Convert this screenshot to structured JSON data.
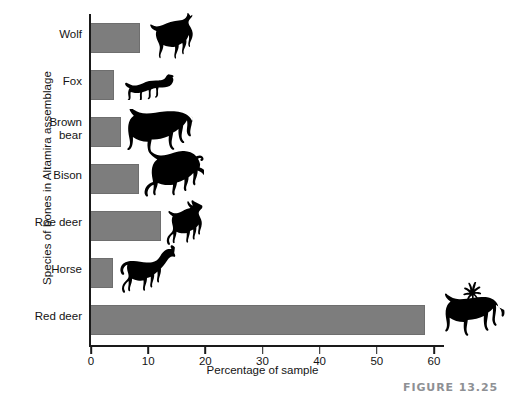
{
  "figure": {
    "caption": "FIGURE 13.25"
  },
  "chart_data": {
    "type": "bar",
    "orientation": "horizontal",
    "title": "",
    "xlabel": "Percentage of sample",
    "ylabel": "Species of bones in Altamira assemblage",
    "xlim": [
      0,
      60
    ],
    "ylim": null,
    "grid": false,
    "legend": null,
    "xticks": [
      0,
      10,
      20,
      30,
      40,
      50,
      60
    ],
    "xticklabels": [
      "0",
      "10",
      "20",
      "30",
      "40",
      "50",
      "60"
    ],
    "categories": [
      "Wolf",
      "Fox",
      "Brown bear",
      "Bison",
      "Roe deer",
      "Horse",
      "Red deer"
    ],
    "values": [
      8.4,
      3.8,
      5.1,
      8.3,
      12.1,
      3.7,
      58.3
    ],
    "bar_color": "#7d7d7d",
    "series": [
      {
        "name": "Percentage of sample",
        "values": [
          8.4,
          3.8,
          5.1,
          8.3,
          12.1,
          3.7,
          58.3
        ]
      }
    ],
    "annotations": [
      {
        "category": "Wolf",
        "icon": "wolf-silhouette"
      },
      {
        "category": "Fox",
        "icon": "fox-silhouette"
      },
      {
        "category": "Brown bear",
        "icon": "brown-bear-silhouette"
      },
      {
        "category": "Bison",
        "icon": "bison-silhouette"
      },
      {
        "category": "Roe deer",
        "icon": "roe-deer-silhouette"
      },
      {
        "category": "Horse",
        "icon": "horse-silhouette"
      },
      {
        "category": "Red deer",
        "icon": "red-deer-silhouette"
      }
    ]
  }
}
